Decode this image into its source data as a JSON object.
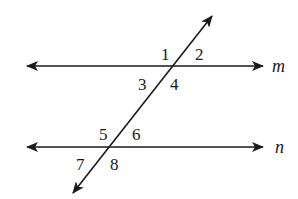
{
  "diagram": {
    "type": "parallel-lines-cut-by-transversal",
    "lines": [
      {
        "name": "m",
        "y": 66,
        "x1": 27,
        "x2": 263
      },
      {
        "name": "n",
        "y": 147,
        "x1": 27,
        "x2": 263
      }
    ],
    "transversal": {
      "x1": 73,
      "y1": 193,
      "x2": 212,
      "y2": 16
    },
    "line_labels": [
      {
        "text": "m",
        "x": 272,
        "y": 72
      },
      {
        "text": "n",
        "x": 275,
        "y": 153
      }
    ],
    "angles": [
      {
        "text": "1",
        "x": 161,
        "y": 60
      },
      {
        "text": "2",
        "x": 195,
        "y": 60
      },
      {
        "text": "3",
        "x": 138,
        "y": 90
      },
      {
        "text": "4",
        "x": 170,
        "y": 90
      },
      {
        "text": "5",
        "x": 99,
        "y": 140
      },
      {
        "text": "6",
        "x": 132,
        "y": 140
      },
      {
        "text": "7",
        "x": 76,
        "y": 170
      },
      {
        "text": "8",
        "x": 110,
        "y": 170
      }
    ],
    "stroke_color": "#1a1a1a"
  }
}
